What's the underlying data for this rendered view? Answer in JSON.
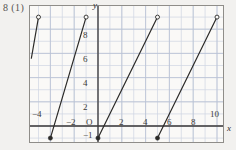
{
  "problem": {
    "label": "8 (1)"
  },
  "colors": {
    "paper": "#f2f1ef",
    "plot_bg": "#faf9f7",
    "grid_minor": "#cfd6e2",
    "grid_major": "#b9c2d4",
    "axis": "#3c3a38",
    "curve": "#2b2a28",
    "frame": "#8f8d89"
  },
  "axes": {
    "x_name": "x",
    "y_name": "y",
    "origin_label": "O",
    "x_ticks": [
      {
        "value": -4,
        "label": "−4"
      },
      {
        "value": -2,
        "label": "−2"
      },
      {
        "value": 2,
        "label": "2"
      },
      {
        "value": 4,
        "label": "4"
      },
      {
        "value": 6,
        "label": "6"
      },
      {
        "value": 8,
        "label": "8"
      },
      {
        "value": 10,
        "label": "10"
      }
    ],
    "y_ticks": [
      {
        "value": -1,
        "label": "−1"
      },
      {
        "value": 2,
        "label": "2"
      },
      {
        "value": 4,
        "label": "4"
      },
      {
        "value": 6,
        "label": "6"
      },
      {
        "value": 8,
        "label": "8"
      }
    ]
  },
  "chart_data": {
    "type": "line",
    "title": "8 (1)",
    "xlabel": "x",
    "ylabel": "y",
    "xlim": [
      -5.7,
      10.7
    ],
    "ylim": [
      -1.7,
      9.7
    ],
    "grid": true,
    "grid_step": 1,
    "legend": "none",
    "series": [
      {
        "name": "segment-1",
        "x": [
          -4,
          -1
        ],
        "y": [
          -1,
          9
        ],
        "start_marker": "closed",
        "end_marker": "open",
        "partial": false
      },
      {
        "name": "segment-2",
        "x": [
          0,
          5
        ],
        "y": [
          -1,
          9
        ],
        "start_marker": "closed",
        "end_marker": "open",
        "partial": false
      },
      {
        "name": "segment-3",
        "x": [
          5,
          10
        ],
        "y": [
          -1,
          9
        ],
        "start_marker": "closed",
        "end_marker": "open",
        "partial": false
      },
      {
        "name": "segment-0-partial",
        "x": [
          -5.6,
          -5.0
        ],
        "y": [
          5.6,
          9
        ],
        "start_marker": "none",
        "end_marker": "open",
        "partial": true
      }
    ]
  }
}
